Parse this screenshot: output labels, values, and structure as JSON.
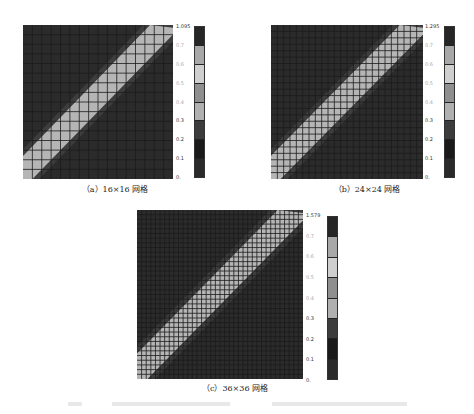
{
  "figure": {
    "panels": [
      {
        "id": "a",
        "caption": "（a）16×16 网格",
        "grid_n": 16,
        "colorbar": {
          "max_label": "1.095",
          "labels": [
            "1.095",
            "0.7",
            "0.6",
            "0.5",
            "0.4",
            "0.3",
            "0.2",
            "0.1",
            "0."
          ]
        }
      },
      {
        "id": "b",
        "caption": "（b）24×24 网格",
        "grid_n": 24,
        "colorbar": {
          "max_label": "1.295",
          "labels": [
            "1.295",
            "0.7",
            "0.6",
            "0.5",
            "0.4",
            "0.3",
            "0.2",
            "0.1",
            "0."
          ]
        }
      },
      {
        "id": "c",
        "caption": "（c）36×36 网格",
        "grid_n": 36,
        "colorbar": {
          "max_label": "1.579",
          "labels": [
            "1.579",
            "0.7",
            "0.6",
            "0.5",
            "0.4",
            "0.3",
            "0.2",
            "0.1",
            "0."
          ]
        }
      }
    ],
    "colorbar_colors": [
      "#262626",
      "#a8a8a8",
      "#cfcfcf",
      "#8f8f8f",
      "#b0b0b0",
      "#3c3c3c",
      "#1a1a1a",
      "#2a2a2a"
    ],
    "figure_caption": ""
  }
}
